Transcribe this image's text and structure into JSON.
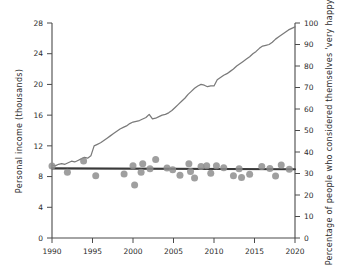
{
  "chart_data": {
    "type": "line",
    "title": "",
    "xlabel": "",
    "ylabel": "Personal income (thousands)",
    "y2label": "Percentage of people who considered themselves 'very happy'",
    "xlim": [
      1990,
      2020
    ],
    "ylim": [
      0,
      28
    ],
    "y2lim": [
      0,
      100
    ],
    "grid": false,
    "legend": "none",
    "x_ticks": [
      "1990",
      "1995",
      "2000",
      "2005",
      "2010",
      "2015",
      "2020"
    ],
    "x_tick_values": [
      1990,
      1995,
      2000,
      2005,
      2010,
      2015,
      2020
    ],
    "y_ticks": [
      "0",
      "4",
      "8",
      "12",
      "16",
      "20",
      "24",
      "28"
    ],
    "y_tick_values": [
      0,
      4,
      8,
      12,
      16,
      20,
      24,
      28
    ],
    "y2_ticks": [
      "0",
      "10",
      "20",
      "30",
      "40",
      "50",
      "60",
      "70",
      "80",
      "90",
      "100"
    ],
    "y2_tick_values": [
      0,
      10,
      20,
      30,
      40,
      50,
      60,
      70,
      80,
      90,
      100
    ],
    "series": [
      {
        "name": "Personal income (thousands)",
        "type": "line",
        "axis": "left",
        "color": "#7a7a7a",
        "x": [
          1990.0,
          1990.4,
          1990.8,
          1991.2,
          1991.6,
          1992.0,
          1992.4,
          1992.8,
          1993.2,
          1993.6,
          1994.0,
          1994.4,
          1994.8,
          1995.2,
          1995.6,
          1996.0,
          1996.4,
          1996.8,
          1997.2,
          1997.6,
          1998.0,
          1998.4,
          1998.8,
          1999.2,
          1999.6,
          2000.0,
          2000.4,
          2000.8,
          2001.2,
          2001.6,
          2002.0,
          2002.4,
          2002.8,
          2003.2,
          2003.6,
          2004.0,
          2004.4,
          2004.8,
          2005.2,
          2005.6,
          2006.0,
          2006.4,
          2006.8,
          2007.2,
          2007.6,
          2008.0,
          2008.4,
          2008.8,
          2009.2,
          2009.6,
          2010.0,
          2010.4,
          2010.8,
          2011.2,
          2011.6,
          2012.0,
          2012.4,
          2012.8,
          2013.2,
          2013.6,
          2014.0,
          2014.4,
          2014.8,
          2015.2,
          2015.6,
          2016.0,
          2016.4,
          2016.8,
          2017.2,
          2017.6,
          2018.0,
          2018.4,
          2018.8,
          2019.2,
          2019.6,
          2020.0
        ],
        "y": [
          9.5,
          9.4,
          9.6,
          9.7,
          9.6,
          9.8,
          10.0,
          9.9,
          10.1,
          10.3,
          10.5,
          10.4,
          10.7,
          12.0,
          12.2,
          12.4,
          12.7,
          13.0,
          13.3,
          13.6,
          13.9,
          14.2,
          14.4,
          14.6,
          14.9,
          15.1,
          15.2,
          15.3,
          15.5,
          15.7,
          16.1,
          15.5,
          15.6,
          15.8,
          16.0,
          16.1,
          16.3,
          16.6,
          17.0,
          17.4,
          17.8,
          18.2,
          18.7,
          19.1,
          19.5,
          19.8,
          20.0,
          19.9,
          19.7,
          19.8,
          19.8,
          20.6,
          20.9,
          21.2,
          21.4,
          21.7,
          22.0,
          22.4,
          22.7,
          23.0,
          23.3,
          23.6,
          24.0,
          24.3,
          24.7,
          25.0,
          25.1,
          25.2,
          25.5,
          25.9,
          26.2,
          26.5,
          26.8,
          27.1,
          27.3,
          27.5
        ]
      },
      {
        "name": "Percentage 'very happy' (trend)",
        "type": "line",
        "axis": "right",
        "color": "#3a3a3a",
        "x": [
          1990,
          2020
        ],
        "y": [
          32.4,
          32.0
        ]
      },
      {
        "name": "Percentage of people who considered themselves 'very happy'",
        "type": "scatter",
        "axis": "right",
        "color": "#8e8e8e",
        "points": [
          {
            "x": 1990.0,
            "y": 33.5
          },
          {
            "x": 1991.9,
            "y": 30.6
          },
          {
            "x": 1993.9,
            "y": 35.8
          },
          {
            "x": 1995.4,
            "y": 29.0
          },
          {
            "x": 1998.9,
            "y": 29.8
          },
          {
            "x": 2000.0,
            "y": 33.6
          },
          {
            "x": 2000.2,
            "y": 24.6
          },
          {
            "x": 2001.0,
            "y": 30.6
          },
          {
            "x": 2001.2,
            "y": 34.5
          },
          {
            "x": 2002.1,
            "y": 32.2
          },
          {
            "x": 2002.8,
            "y": 36.5
          },
          {
            "x": 2004.2,
            "y": 32.6
          },
          {
            "x": 2004.9,
            "y": 31.8
          },
          {
            "x": 2005.8,
            "y": 29.2
          },
          {
            "x": 2006.9,
            "y": 34.5
          },
          {
            "x": 2007.1,
            "y": 30.9
          },
          {
            "x": 2007.6,
            "y": 27.9
          },
          {
            "x": 2008.4,
            "y": 33.3
          },
          {
            "x": 2009.1,
            "y": 33.6
          },
          {
            "x": 2009.6,
            "y": 30.1
          },
          {
            "x": 2010.3,
            "y": 33.6
          },
          {
            "x": 2011.2,
            "y": 32.7
          },
          {
            "x": 2012.4,
            "y": 29.0
          },
          {
            "x": 2013.1,
            "y": 32.2
          },
          {
            "x": 2013.4,
            "y": 28.1
          },
          {
            "x": 2014.4,
            "y": 29.6
          },
          {
            "x": 2015.9,
            "y": 33.2
          },
          {
            "x": 2016.9,
            "y": 32.3
          },
          {
            "x": 2017.6,
            "y": 28.8
          },
          {
            "x": 2018.3,
            "y": 34.0
          },
          {
            "x": 2019.3,
            "y": 32.0
          }
        ]
      }
    ]
  },
  "axes": {
    "left_title": "Personal income (thousands)",
    "right_title": "Percentage of people who considered themselves 'very happy'"
  }
}
